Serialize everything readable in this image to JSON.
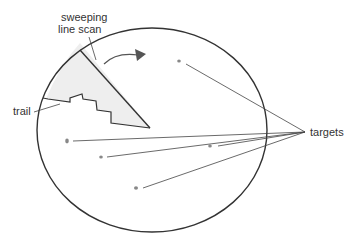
{
  "diagram": {
    "labels": {
      "sweep_line1": "sweeping",
      "sweep_line2": "line scan",
      "trail": "trail",
      "targets": "targets"
    },
    "colors": {
      "stroke": "#333333",
      "trail_fill": "#eeeeee",
      "target_dot": "#888888",
      "leader": "#444444"
    },
    "screen": {
      "cx": 152,
      "cy": 130,
      "rx": 115,
      "ry": 102
    },
    "targets": [
      {
        "x": 179,
        "y": 61
      },
      {
        "x": 67,
        "y": 141
      },
      {
        "x": 101,
        "y": 157
      },
      {
        "x": 210,
        "y": 146
      },
      {
        "x": 136,
        "y": 188
      }
    ],
    "targets_convergence": {
      "x": 305,
      "y": 132
    }
  }
}
